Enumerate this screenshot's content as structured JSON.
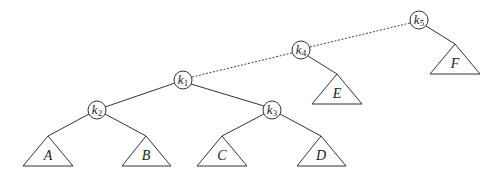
{
  "diagram": {
    "type": "binary-tree-rotation",
    "stroke_color": "#333333",
    "background": "#ffffff",
    "nodes": [
      {
        "id": "k1",
        "letter": "k",
        "sub": "1",
        "cx": 183,
        "cy": 80
      },
      {
        "id": "k2",
        "letter": "k",
        "sub": "2",
        "cx": 97,
        "cy": 110
      },
      {
        "id": "k3",
        "letter": "k",
        "sub": "3",
        "cx": 272,
        "cy": 110
      },
      {
        "id": "k4",
        "letter": "k",
        "sub": "4",
        "cx": 301,
        "cy": 50
      },
      {
        "id": "k5",
        "letter": "k",
        "sub": "5",
        "cx": 419,
        "cy": 20
      }
    ],
    "subtrees": [
      {
        "id": "A",
        "label": "A",
        "apex_x": 48,
        "apex_y": 136,
        "parent": "k2"
      },
      {
        "id": "B",
        "label": "B",
        "apex_x": 146,
        "apex_y": 136,
        "parent": "k2"
      },
      {
        "id": "C",
        "label": "C",
        "apex_x": 222,
        "apex_y": 136,
        "parent": "k3"
      },
      {
        "id": "D",
        "label": "D",
        "apex_x": 321,
        "apex_y": 136,
        "parent": "k3"
      },
      {
        "id": "E",
        "label": "E",
        "apex_x": 337,
        "apex_y": 74,
        "parent": "k4"
      },
      {
        "id": "F",
        "label": "F",
        "apex_x": 455,
        "apex_y": 44,
        "parent": "k5"
      }
    ],
    "edges": [
      {
        "from": "k1",
        "to": "k2",
        "style": "solid"
      },
      {
        "from": "k1",
        "to": "k3",
        "style": "solid"
      },
      {
        "from": "k1",
        "to": "k4",
        "style": "dashed"
      },
      {
        "from": "k4",
        "to": "k5",
        "style": "dashed"
      },
      {
        "from": "k2",
        "to": "A",
        "style": "solid"
      },
      {
        "from": "k2",
        "to": "B",
        "style": "solid"
      },
      {
        "from": "k3",
        "to": "C",
        "style": "solid"
      },
      {
        "from": "k3",
        "to": "D",
        "style": "solid"
      },
      {
        "from": "k4",
        "to": "E",
        "style": "solid"
      },
      {
        "from": "k5",
        "to": "F",
        "style": "solid"
      }
    ]
  }
}
